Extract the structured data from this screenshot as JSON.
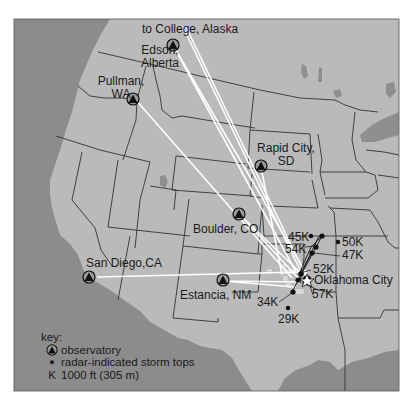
{
  "map": {
    "title": "Observatories and radar-indicated storm tops, Oklahoma City storm",
    "colors": {
      "ocean": "#8a8a8a",
      "land": "#b9b9b9",
      "border": "#333333",
      "sight_lines": "#ffffff",
      "frame": "#555555"
    },
    "observatories": [
      {
        "id": "college",
        "label": "to College, Alaska"
      },
      {
        "id": "edson",
        "label_line1": "Edson,",
        "label_line2": "Alberta"
      },
      {
        "id": "pullman",
        "label_line1": "Pullman,",
        "label_line2": "WA"
      },
      {
        "id": "rapid_city",
        "label_line1": "Rapid City,",
        "label_line2": "SD"
      },
      {
        "id": "boulder",
        "label": "Boulder, CO"
      },
      {
        "id": "san_diego",
        "label": "San Diego,CA"
      },
      {
        "id": "estancia",
        "label": "Estancia, NM"
      }
    ],
    "target_city": {
      "label": "Oklahoma City"
    },
    "storm_tops": [
      {
        "label": "45K",
        "value_kft": 45
      },
      {
        "label": "54K",
        "value_kft": 54
      },
      {
        "label": "50K",
        "value_kft": 50
      },
      {
        "label": "47K",
        "value_kft": 47
      },
      {
        "label": "52K",
        "value_kft": 52
      },
      {
        "label": "57K",
        "value_kft": 57
      },
      {
        "label": "34K",
        "value_kft": 34
      },
      {
        "label": "29K",
        "value_kft": 29
      }
    ],
    "key": {
      "title": "key:",
      "observatory": "observatory",
      "storm_tops": "radar-indicated storm tops",
      "k_symbol": "K",
      "k_meaning": "1000 ft (305 m)"
    }
  }
}
